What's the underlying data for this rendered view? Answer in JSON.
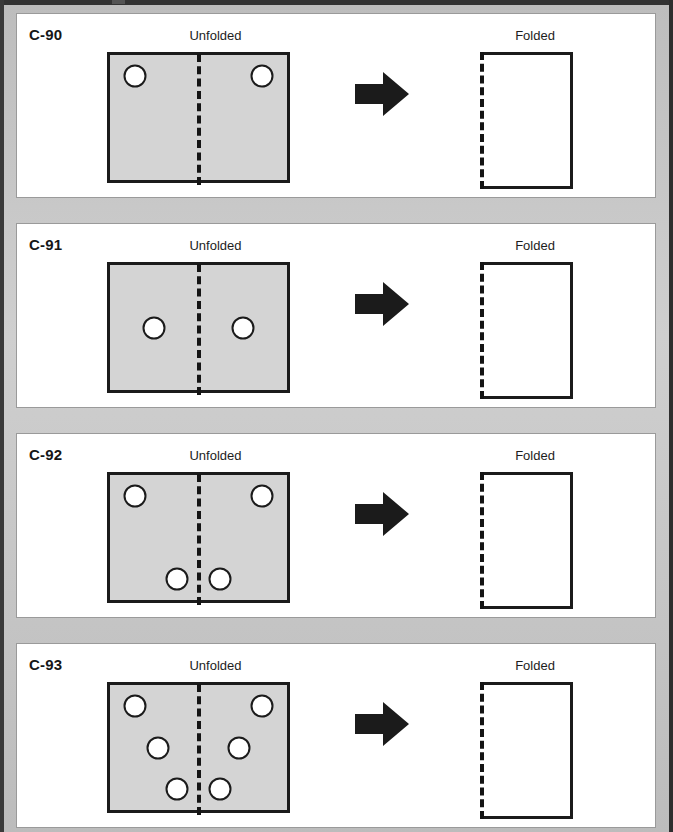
{
  "page": {
    "background_color": "#ffffff",
    "matting_color": "#c6c6c6",
    "ink_color": "#1b1b1b",
    "sheet_fill_color": "#d4d4d4",
    "arrow_color": "#1b1b1b"
  },
  "captions": {
    "unfolded": "Unfolded",
    "folded": "Folded"
  },
  "panels": [
    {
      "code": "C-90",
      "unfolded_caption": "Unfolded",
      "folded_caption": "Folded",
      "arrow": "right-arrow-icon",
      "holes": [
        {
          "x_pct": 14,
          "y_pct": 17
        },
        {
          "x_pct": 86,
          "y_pct": 17
        }
      ]
    },
    {
      "code": "C-91",
      "unfolded_caption": "Unfolded",
      "folded_caption": "Folded",
      "arrow": "right-arrow-icon",
      "holes": [
        {
          "x_pct": 25,
          "y_pct": 50
        },
        {
          "x_pct": 75,
          "y_pct": 50
        }
      ]
    },
    {
      "code": "C-92",
      "unfolded_caption": "Unfolded",
      "folded_caption": "Folded",
      "arrow": "right-arrow-icon",
      "holes": [
        {
          "x_pct": 14,
          "y_pct": 17
        },
        {
          "x_pct": 86,
          "y_pct": 17
        },
        {
          "x_pct": 38,
          "y_pct": 83
        },
        {
          "x_pct": 62,
          "y_pct": 83
        }
      ]
    },
    {
      "code": "C-93",
      "unfolded_caption": "Unfolded",
      "folded_caption": "Folded",
      "arrow": "right-arrow-icon",
      "holes": [
        {
          "x_pct": 14,
          "y_pct": 17
        },
        {
          "x_pct": 86,
          "y_pct": 17
        },
        {
          "x_pct": 27,
          "y_pct": 50
        },
        {
          "x_pct": 73,
          "y_pct": 50
        },
        {
          "x_pct": 38,
          "y_pct": 83
        },
        {
          "x_pct": 62,
          "y_pct": 83
        }
      ]
    }
  ]
}
